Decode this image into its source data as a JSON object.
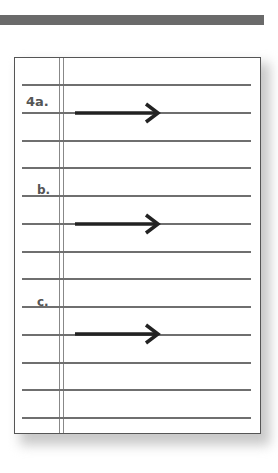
{
  "worksheet": {
    "items": [
      {
        "label": "4a.",
        "has_arrow": true
      },
      {
        "label": "b.",
        "has_arrow": true
      },
      {
        "label": "c.",
        "has_arrow": true
      }
    ],
    "rule_count": 13,
    "colors": {
      "rule": "#6f6f6f",
      "arrow": "#222222",
      "label": "#555555",
      "header_bar": "#6a6a6a"
    }
  }
}
